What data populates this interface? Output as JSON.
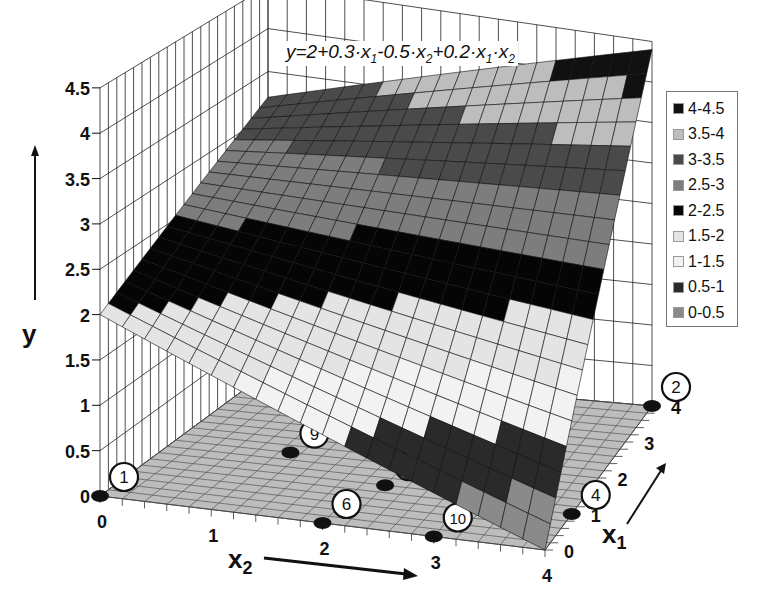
{
  "chart_data": {
    "type": "surface3d",
    "title": "",
    "equation": "y=2+0.3·x1-0.5·x2+0.2·x1·x2",
    "equation_parts": {
      "lhs": "y=2+0.3·x",
      "s1": "1",
      "m1": "-0.5·x",
      "s2": "2",
      "m2": "+0.2·x",
      "s3": "1",
      "m3": "·x",
      "s4": "2"
    },
    "coefficients": {
      "b0": 2,
      "b1": 0.3,
      "b2": -0.5,
      "b12": 0.2
    },
    "xlabel": "x2",
    "ylabel": "y",
    "zlabel": "x1",
    "x2_range": [
      0,
      4
    ],
    "x1_range": [
      0,
      4
    ],
    "y_range": [
      0,
      4.5
    ],
    "x2_ticks": [
      "0",
      "1",
      "2",
      "3",
      "4"
    ],
    "x1_ticks": [
      "0",
      "1",
      "2",
      "3",
      "4"
    ],
    "y_ticks": [
      "0",
      "0.5",
      "1",
      "1.5",
      "2",
      "2.5",
      "3",
      "3.5",
      "4",
      "4.5"
    ],
    "grid": true,
    "legend_position": "right",
    "legend": [
      {
        "label": "4-4.5",
        "color": "#111111"
      },
      {
        "label": "3.5-4",
        "color": "#bdbdbd"
      },
      {
        "label": "3-3.5",
        "color": "#4a4a4a"
      },
      {
        "label": "2.5-3",
        "color": "#7d7d7d"
      },
      {
        "label": "2-2.5",
        "color": "#050505"
      },
      {
        "label": "1.5-2",
        "color": "#e4e4e4"
      },
      {
        "label": "1-1.5",
        "color": "#f2f2f2"
      },
      {
        "label": "0.5-1",
        "color": "#2a2a2a"
      },
      {
        "label": "0-0.5",
        "color": "#8a8a8a"
      }
    ],
    "surface_corners": [
      {
        "x1": 0,
        "x2": 0,
        "y": 2.0
      },
      {
        "x1": 0,
        "x2": 4,
        "y": 0.0
      },
      {
        "x1": 4,
        "x2": 0,
        "y": 3.2
      },
      {
        "x1": 4,
        "x2": 4,
        "y": 4.4
      }
    ],
    "design_points": [
      {
        "id": "1",
        "x1": 0,
        "x2": 0
      },
      {
        "id": "2",
        "x1": 4,
        "x2": 4
      },
      {
        "id": "3",
        "x1": 2.2,
        "x2": 3.2
      },
      {
        "id": "4",
        "x1": 1,
        "x2": 4
      },
      {
        "id": "5",
        "x1": 2.6,
        "x2": 1.3
      },
      {
        "id": "6",
        "x1": 0,
        "x2": 2
      },
      {
        "id": "7",
        "x1": 1.2,
        "x2": 2.2
      },
      {
        "id": "8",
        "x1": 3.8,
        "x2": 1.9
      },
      {
        "id": "9",
        "x1": 1.8,
        "x2": 1.1
      },
      {
        "id": "10",
        "x1": 0,
        "x2": 3
      }
    ]
  }
}
